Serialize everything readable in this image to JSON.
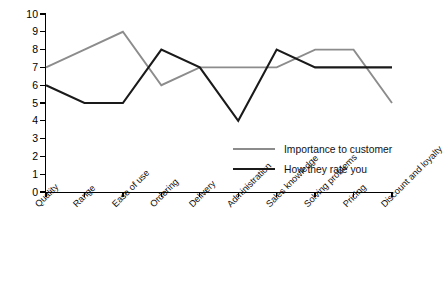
{
  "chart_data": {
    "type": "line",
    "title": "",
    "xlabel": "",
    "ylabel": "",
    "ylim": [
      0,
      10
    ],
    "ytick_step": 1,
    "grid": false,
    "legend_position": "inside-right",
    "categories": [
      "Quality",
      "Range",
      "Ease of use",
      "Ordering",
      "Delivery",
      "Administration",
      "Sales knowledge",
      "Solving problems",
      "Pricing",
      "Discount and loyalty"
    ],
    "yticks": [
      "0",
      "1",
      "2",
      "3",
      "4",
      "5",
      "6",
      "7",
      "8",
      "9",
      "10"
    ],
    "series": [
      {
        "name": "Importance to customer",
        "color": "#8c8c8c",
        "values": [
          7,
          8,
          9,
          6,
          7,
          7,
          7,
          8,
          8,
          5
        ]
      },
      {
        "name": "How they rate you",
        "color": "#1a1a1a",
        "values": [
          6,
          5,
          5,
          8,
          7,
          4,
          8,
          7,
          7,
          7
        ]
      }
    ]
  },
  "legend": {
    "items": [
      {
        "label": "Importance to customer"
      },
      {
        "label": "How they rate you"
      }
    ]
  }
}
